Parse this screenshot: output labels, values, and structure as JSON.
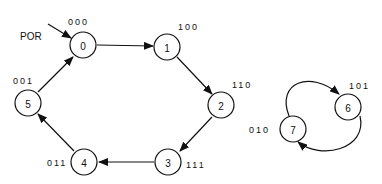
{
  "diagram": {
    "title": "",
    "reset_label": "POR",
    "nodes": [
      {
        "id": "0",
        "label": "0",
        "code": "000",
        "x": 83,
        "y": 45
      },
      {
        "id": "1",
        "label": "1",
        "code": "100",
        "x": 167,
        "y": 47
      },
      {
        "id": "2",
        "label": "2",
        "code": "110",
        "x": 221,
        "y": 105
      },
      {
        "id": "3",
        "label": "3",
        "code": "111",
        "x": 168,
        "y": 162
      },
      {
        "id": "4",
        "label": "4",
        "code": "011",
        "x": 84,
        "y": 162
      },
      {
        "id": "5",
        "label": "5",
        "code": "001",
        "x": 28,
        "y": 103
      },
      {
        "id": "6",
        "label": "6",
        "code": "101",
        "x": 348,
        "y": 107
      },
      {
        "id": "7",
        "label": "7",
        "code": "010",
        "x": 293,
        "y": 129
      }
    ],
    "edges": [
      {
        "from": "POR",
        "to": "0"
      },
      {
        "from": "0",
        "to": "1"
      },
      {
        "from": "1",
        "to": "2"
      },
      {
        "from": "2",
        "to": "3"
      },
      {
        "from": "3",
        "to": "4"
      },
      {
        "from": "4",
        "to": "5"
      },
      {
        "from": "5",
        "to": "0"
      },
      {
        "from": "7",
        "to": "6"
      },
      {
        "from": "6",
        "to": "7"
      }
    ]
  }
}
